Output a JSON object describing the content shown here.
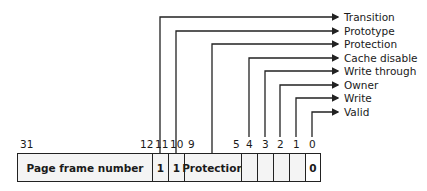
{
  "diagram": {
    "fields": [
      {
        "name": "page-frame-number",
        "label": "Page frame number",
        "value": ""
      },
      {
        "name": "bit-11",
        "label": "1"
      },
      {
        "name": "bit-10",
        "label": "1"
      },
      {
        "name": "protection",
        "label": "Protection"
      },
      {
        "name": "bit-4",
        "label": ""
      },
      {
        "name": "bit-3",
        "label": ""
      },
      {
        "name": "bit-2",
        "label": ""
      },
      {
        "name": "bit-1",
        "label": ""
      },
      {
        "name": "bit-0",
        "label": "0"
      }
    ],
    "bit_numbers": {
      "b31": "31",
      "b12": "12",
      "b11": "11",
      "b10": "10",
      "b9": "9",
      "b5": "5",
      "b4": "4",
      "b3": "3",
      "b2": "2",
      "b1": "1",
      "b0": "0"
    },
    "callouts": [
      {
        "label": "Transition"
      },
      {
        "label": "Prototype"
      },
      {
        "label": "Protection"
      },
      {
        "label": "Cache disable"
      },
      {
        "label": "Write through"
      },
      {
        "label": "Owner"
      },
      {
        "label": "Write"
      },
      {
        "label": "Valid"
      }
    ]
  }
}
